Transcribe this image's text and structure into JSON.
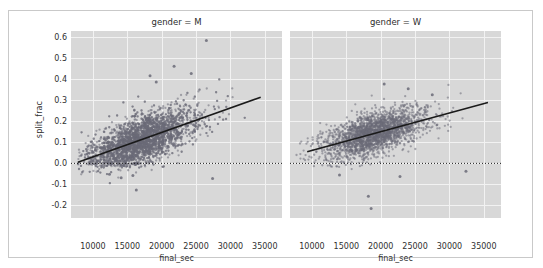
{
  "figure": {
    "background_color": "#ffffff",
    "border_color": "#c9c9c9",
    "panel_background_color": "#d8d8d8",
    "grid_color": "#f2f2f2",
    "point_color": "#6b6b78",
    "line_color": "#1a1a1a"
  },
  "axes": {
    "ylabel": "split_frac",
    "xlabel": "final_sec",
    "yticks": [
      "0.6",
      "0.5",
      "0.4",
      "0.3",
      "0.2",
      "0.1",
      "0.0",
      "-0.1",
      "-0.2"
    ],
    "ytick_values": [
      0.6,
      0.5,
      0.4,
      0.3,
      0.2,
      0.1,
      0.0,
      -0.1,
      -0.2
    ],
    "xticks": [
      "10000",
      "15000",
      "20000",
      "25000",
      "30000",
      "35000"
    ],
    "xtick_values": [
      10000,
      15000,
      20000,
      25000,
      30000,
      35000
    ],
    "ylim": [
      -0.26,
      0.63
    ],
    "xlim": [
      6800,
      37500
    ]
  },
  "panels": [
    {
      "id": "m",
      "title": "gender = M"
    },
    {
      "id": "w",
      "title": "gender = W"
    }
  ],
  "chart_data": {
    "type": "scatter",
    "title": "",
    "xlabel": "final_sec",
    "ylabel": "split_frac",
    "xlim": [
      6800,
      37500
    ],
    "ylim": [
      -0.26,
      0.63
    ],
    "grid": true,
    "legend": "none",
    "facets": [
      {
        "name": "gender = M",
        "n_points": 3900,
        "x_mean": 16800,
        "x_sd": 3700,
        "y_intercept_at_xmin": 0.005,
        "y_resid_sd": 0.055,
        "regression": {
          "x0": 7800,
          "y0": 0.005,
          "x1": 34400,
          "y1": 0.315
        },
        "reference_line": {
          "y": 0.0,
          "style": "dotted"
        },
        "outliers": [
          {
            "x": 26500,
            "y": 0.585
          },
          {
            "x": 21800,
            "y": 0.462
          },
          {
            "x": 24300,
            "y": 0.428
          },
          {
            "x": 18300,
            "y": 0.417
          },
          {
            "x": 19200,
            "y": 0.387
          },
          {
            "x": 16300,
            "y": -0.127
          },
          {
            "x": 27400,
            "y": -0.072
          },
          {
            "x": 14100,
            "y": -0.068
          },
          {
            "x": 15800,
            "y": -0.058
          },
          {
            "x": 12400,
            "y": -0.052
          }
        ]
      },
      {
        "name": "gender = W",
        "n_points": 2300,
        "x_mean": 18900,
        "x_sd": 3500,
        "y_intercept_at_xmin": 0.045,
        "y_resid_sd": 0.048,
        "regression": {
          "x0": 9300,
          "y0": 0.055,
          "x1": 35600,
          "y1": 0.29
        },
        "reference_line": {
          "y": 0.0,
          "style": "dotted"
        },
        "outliers": [
          {
            "x": 20500,
            "y": 0.378
          },
          {
            "x": 24000,
            "y": 0.355
          },
          {
            "x": 27500,
            "y": 0.327
          },
          {
            "x": 18600,
            "y": -0.215
          },
          {
            "x": 18200,
            "y": -0.157
          },
          {
            "x": 32400,
            "y": -0.038
          },
          {
            "x": 14000,
            "y": -0.055
          },
          {
            "x": 22800,
            "y": -0.062
          }
        ]
      }
    ]
  }
}
